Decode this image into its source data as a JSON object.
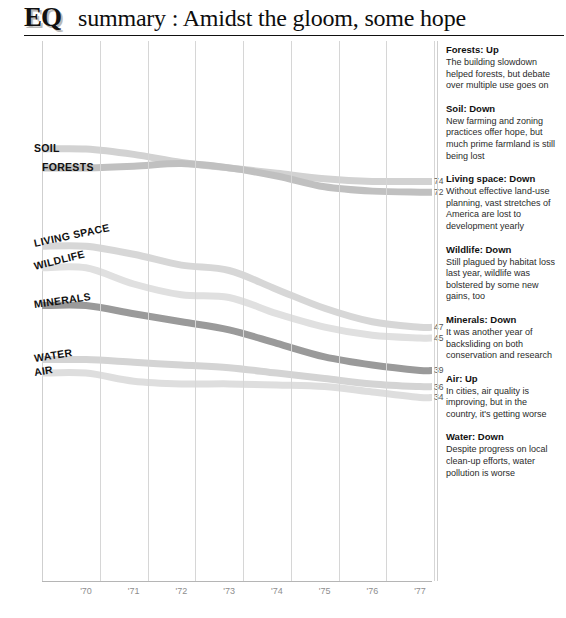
{
  "header": {
    "logo": "EQ",
    "title": "summary : Amidst the gloom, some hope"
  },
  "chart_data": {
    "type": "line",
    "title": "EQ summary : Amidst the gloom, some hope",
    "xlabel": "",
    "ylabel": "",
    "grid": "vertical",
    "legend": "inline-labels",
    "ylim": [
      0,
      100
    ],
    "yticks": [
      100,
      90,
      80,
      70,
      60,
      50,
      40,
      30,
      20,
      10
    ],
    "x": [
      "'70",
      "'71",
      "'72",
      "'73",
      "'74",
      "'75",
      "'76",
      "'77"
    ],
    "series": [
      {
        "name": "SOIL",
        "label": "SOIL",
        "end_value": 74,
        "values": [
          80,
          79,
          77.5,
          76.5,
          75.5,
          74.5,
          74,
          74
        ],
        "color": "#d2d2d2",
        "label_x_pct": 0,
        "label_y": 80,
        "label_rotate": 0
      },
      {
        "name": "FORESTS",
        "label": "FORESTS",
        "end_value": 72,
        "values": [
          76.5,
          76.8,
          77.3,
          76.5,
          75,
          73,
          72.2,
          72
        ],
        "color": "#c0c0c0",
        "label_x_pct": 4,
        "label_y": 76.4,
        "label_rotate": 0
      },
      {
        "name": "LIVING SPACE",
        "label": "LIVING SPACE",
        "end_value": 47,
        "values": [
          62,
          60.5,
          58.5,
          57.5,
          54,
          50.5,
          48,
          47
        ],
        "color": "#d7d7d7",
        "label_x_pct": 0,
        "label_y": 62.5,
        "label_rotate": -12
      },
      {
        "name": "WILDLIFE",
        "label": "WILDLIFE",
        "end_value": 45,
        "values": [
          58,
          55,
          53,
          52.5,
          49.5,
          47,
          45.5,
          45
        ],
        "color": "#e0e0e0",
        "label_x_pct": 0,
        "label_y": 58.2,
        "label_rotate": -14
      },
      {
        "name": "MINERALS",
        "label": "MINERALS",
        "end_value": 39,
        "values": [
          51,
          49.5,
          48,
          46.5,
          44,
          41.5,
          40,
          39
        ],
        "color": "#9a9a9a",
        "label_x_pct": 0,
        "label_y": 51.2,
        "label_rotate": -8
      },
      {
        "name": "WATER",
        "label": "WATER",
        "end_value": 36,
        "values": [
          41,
          40.5,
          40,
          39.5,
          38.5,
          37.5,
          36.5,
          36
        ],
        "color": "#d4d4d4",
        "label_x_pct": 0,
        "label_y": 41.2,
        "label_rotate": -9
      },
      {
        "name": "AIR",
        "label": "AIR",
        "end_value": 34,
        "values": [
          38.5,
          37,
          36.5,
          36.5,
          36.3,
          36,
          35,
          34
        ],
        "color": "#dedede",
        "label_x_pct": 0,
        "label_y": 38.6,
        "label_rotate": -9
      }
    ]
  },
  "notes": [
    {
      "head": "Forests: Up",
      "body": "The building slowdown helped forests, but debate over multiple use goes on"
    },
    {
      "head": "Soil: Down",
      "body": "New farming and zoning practices offer hope, but much prime farmland is still being lost"
    },
    {
      "head": "Living space: Down",
      "body": "Without effective land-use planning, vast stretches of America are lost to development yearly"
    },
    {
      "head": "Wildlife: Down",
      "body": "Still plagued by habitat loss last year, wildlife was bolstered by some new gains, too"
    },
    {
      "head": "Minerals: Down",
      "body": "It was another year of backsliding on both conservation and research"
    },
    {
      "head": "Air: Up",
      "body": "In cities, air quality is improving, but in the country, it's getting worse"
    },
    {
      "head": "Water: Down",
      "body": "Despite progress on local clean-up efforts, water pollution is worse"
    }
  ]
}
